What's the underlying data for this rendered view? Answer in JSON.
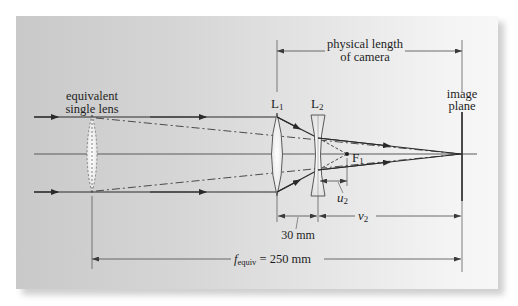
{
  "labels": {
    "equivalent_lens_line1": "equivalent",
    "equivalent_lens_line2": "single lens",
    "physical_length_line1": "physical length",
    "physical_length_line2": "of camera",
    "image_plane_line1": "image",
    "image_plane_line2": "plane",
    "lens1": "L",
    "lens1_sub": "1",
    "lens2": "L",
    "lens2_sub": "2",
    "focal_point": "F",
    "focal_point_sub": "1",
    "u2": "u",
    "u2_sub": "2",
    "v2": "v",
    "v2_sub": "2",
    "separation": "30 mm",
    "f_equiv_symbol": "f",
    "f_equiv_sub": "equiv",
    "f_equiv_value": " = 250 mm"
  },
  "colors": {
    "ray": "#2a2a2a",
    "axis": "#555555",
    "dimension": "#4a4a4a",
    "lens_fill": "#f4f4f4",
    "text": "#1e1e1e"
  }
}
